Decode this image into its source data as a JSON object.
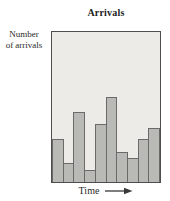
{
  "chart_data": {
    "type": "bar",
    "title": "Arrivals",
    "ylabel": "Number of arrivals",
    "xlabel": "Time",
    "categories": [
      "1",
      "2",
      "3",
      "4",
      "5",
      "6",
      "7",
      "8",
      "9",
      "10"
    ],
    "values": [
      29,
      13,
      47,
      8,
      39,
      57,
      20,
      16,
      29,
      36
    ],
    "value_units": "percent of unlabeled y-axis height",
    "ylim": [
      0,
      100
    ],
    "grid": false,
    "legend": false,
    "bar_gap": 0
  },
  "labels": {
    "title": "Arrivals",
    "ylabel_line1": "Number",
    "ylabel_line2": "of arrivals",
    "xlabel_text": "Time",
    "x_arrow": "right-arrow"
  },
  "colors": {
    "page_bg": "#ffffff",
    "plot_bg": "#ecebe7",
    "plot_border": "#4f4e4c",
    "bar_fill": "#b9b9b6",
    "bar_border": "#6b6a68",
    "text": "#2b2a28",
    "arrow": "#3a3938"
  }
}
